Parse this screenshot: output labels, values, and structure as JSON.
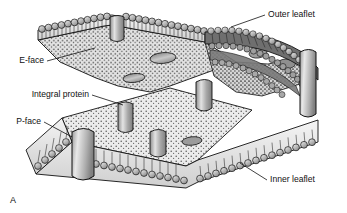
{
  "figure": {
    "panel_label": "A",
    "caption_absent": true,
    "type": "freeze-fracture cell membrane diagram",
    "background_color": "#ffffff",
    "line_color": "#111111"
  },
  "labels": {
    "outer_leaflet": "Outer leaflet",
    "e_face": "E-face",
    "integral_protein": "Integral protein",
    "p_face": "P-face",
    "inner_leaflet": "Inner leaflet"
  },
  "colors": {
    "fracture_face_light": "#ededed",
    "fracture_face_dark": "#c9c9c9",
    "lipid_head_fill": "#b9b9b9",
    "lipid_head_highlight": "#e8e8e8",
    "protein_fill": "#a9a9a9",
    "protein_highlight": "#dedede",
    "outline": "#111111",
    "stipple": "#4a4a4a"
  },
  "structures": {
    "outer_leaflet_description": "Upper phospholipid monolayer with spherical polar heads facing outward and hydrophobic tails inward",
    "inner_leaflet_description": "Lower phospholipid monolayer with spherical polar heads facing inward of the cell",
    "e_face_description": "Exoplasmic fracture face, upper split surface bearing oval pits",
    "p_face_description": "Protoplasmic fracture face, lower split surface bearing protein particles",
    "integral_protein_description": "Transmembrane proteins spanning the bilayer, appearing as particles on the P-face and pits on the E-face"
  },
  "elements": {
    "e_face_pits": 4,
    "p_face_particles": 5,
    "edge_proteins": 3
  }
}
